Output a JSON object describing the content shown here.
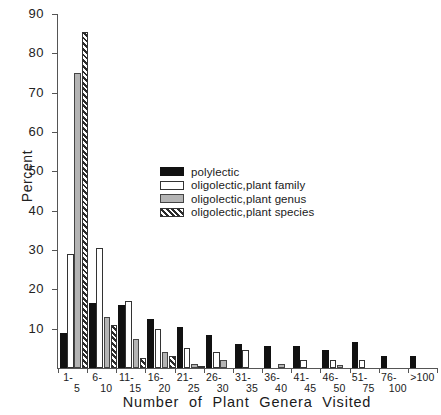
{
  "chart_data": {
    "type": "bar",
    "title": "",
    "xlabel": "Number of  Plant  Genera  Visited",
    "ylabel": "Percent",
    "ylim": [
      0,
      90
    ],
    "ytick_step": 10,
    "grid": false,
    "legend_position": "inside-upper-center",
    "categories": [
      "1-5",
      "6-10",
      "11-15",
      "16-20",
      "21-25",
      "26-30",
      "31-35",
      "36-40",
      "41-45",
      "46-50",
      "51-75",
      "76-100",
      ">100"
    ],
    "category_parts": [
      {
        "lo": "1-",
        "hi": "5"
      },
      {
        "lo": "6-",
        "hi": "10"
      },
      {
        "lo": "11-",
        "hi": "15"
      },
      {
        "lo": "16-",
        "hi": "20"
      },
      {
        "lo": "21-",
        "hi": "25"
      },
      {
        "lo": "26-",
        "hi": "30"
      },
      {
        "lo": "31-",
        "hi": "35"
      },
      {
        "lo": "36-",
        "hi": "40"
      },
      {
        "lo": "41-",
        "hi": "45"
      },
      {
        "lo": "46-",
        "hi": "50"
      },
      {
        "lo": "51-",
        "hi": "75"
      },
      {
        "lo": "76-",
        "hi": "100"
      },
      {
        "lo": ">100",
        "hi": ""
      }
    ],
    "ytick_labels": [
      "0",
      "10",
      "20",
      "30",
      "40",
      "50",
      "60",
      "70",
      "80",
      "90"
    ],
    "series": [
      {
        "name": "polylectic",
        "key": "polylectic",
        "color": "#111111",
        "values": [
          9,
          16.5,
          16,
          12.5,
          10.5,
          8.5,
          6,
          5.5,
          5.5,
          4.5,
          6.5,
          3,
          3
        ]
      },
      {
        "name": "oligolectic,plant family",
        "key": "family",
        "color": "#ffffff",
        "values": [
          29,
          30.5,
          17,
          10,
          5,
          4,
          4.5,
          0,
          2,
          2,
          2,
          0,
          0
        ]
      },
      {
        "name": "oligolectic,plant genus",
        "key": "genus",
        "color": "#b4b4b4",
        "values": [
          75,
          13,
          7.5,
          4,
          1,
          2,
          0,
          1,
          0,
          0.8,
          0,
          0,
          0
        ]
      },
      {
        "name": "oligolectic,plant species",
        "key": "species",
        "color": "hatched",
        "values": [
          85.5,
          11,
          2.5,
          3,
          0.5,
          0,
          0,
          0,
          0,
          0,
          0,
          0,
          0
        ]
      }
    ]
  },
  "legend": {
    "items": [
      {
        "label": "polylectic",
        "key": "polylectic"
      },
      {
        "label": "oligolectic,plant family",
        "key": "family"
      },
      {
        "label": "oligolectic,plant genus",
        "key": "genus"
      },
      {
        "label": "oligolectic,plant species",
        "key": "species"
      }
    ]
  }
}
